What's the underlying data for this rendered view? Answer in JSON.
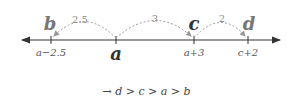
{
  "diagram": {
    "type": "number-line",
    "axis": {
      "y": 40,
      "x_start": 20,
      "x_end": 282,
      "color": "#333333",
      "arrows": "both"
    },
    "points": [
      {
        "name": "b",
        "tick_label": "a−2.5",
        "x": 51,
        "emphasis": "secondary"
      },
      {
        "name": "a",
        "tick_label": "",
        "x": 116,
        "emphasis": "main",
        "below_label": "a"
      },
      {
        "name": "c",
        "tick_label": "a+3",
        "x": 194,
        "emphasis": "main"
      },
      {
        "name": "d",
        "tick_label": "c+2",
        "x": 248,
        "emphasis": "secondary"
      }
    ],
    "jumps": [
      {
        "from": "a",
        "to": "b",
        "label": "2.5"
      },
      {
        "from": "a",
        "to": "c",
        "label": "3"
      },
      {
        "from": "c",
        "to": "d",
        "label": "2"
      }
    ],
    "colors": {
      "axis": "#333333",
      "dashed_arc": "#999999",
      "label_main": "#333333",
      "label_secondary": "#777777"
    }
  },
  "labels": {
    "b": "b",
    "a": "a",
    "c": "c",
    "d": "d",
    "tick_b": "a−2.5",
    "tick_c": "a+3",
    "tick_d": "c+2",
    "jump_ab": "2.5",
    "jump_ac": "3",
    "jump_cd": "2"
  },
  "conclusion": {
    "arrow": "→",
    "text": "d > c > a > b"
  }
}
